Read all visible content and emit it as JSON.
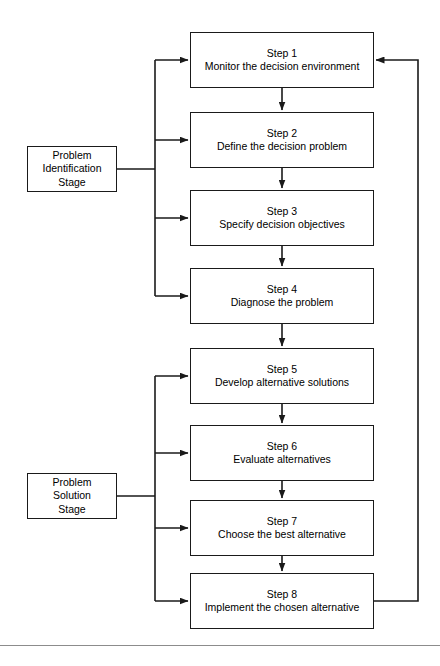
{
  "diagram": {
    "stages": [
      {
        "id": "problem-identification-stage",
        "lines": [
          "Problem",
          "Identification",
          "Stage"
        ],
        "x": 27,
        "y": 146,
        "w": 90,
        "h": 46,
        "connects_to": [
          "step-1",
          "step-2",
          "step-3",
          "step-4"
        ]
      },
      {
        "id": "problem-solution-stage",
        "lines": [
          "Problem",
          "Solution",
          "Stage"
        ],
        "x": 27,
        "y": 473,
        "w": 90,
        "h": 46,
        "connects_to": [
          "step-5",
          "step-6",
          "step-7",
          "step-8"
        ]
      }
    ],
    "steps": [
      {
        "id": "step-1",
        "label": "Step 1",
        "desc": "Monitor the decision environment",
        "x": 190,
        "y": 32,
        "w": 184,
        "h": 56
      },
      {
        "id": "step-2",
        "label": "Step 2",
        "desc": "Define the decision problem",
        "x": 190,
        "y": 112,
        "w": 184,
        "h": 56
      },
      {
        "id": "step-3",
        "label": "Step 3",
        "desc": "Specify decision objectives",
        "x": 190,
        "y": 190,
        "w": 184,
        "h": 56
      },
      {
        "id": "step-4",
        "label": "Step 4",
        "desc": "Diagnose the problem",
        "x": 190,
        "y": 268,
        "w": 184,
        "h": 56
      },
      {
        "id": "step-5",
        "label": "Step 5",
        "desc": "Develop alternative solutions",
        "x": 190,
        "y": 348,
        "w": 184,
        "h": 56
      },
      {
        "id": "step-6",
        "label": "Step 6",
        "desc": "Evaluate alternatives",
        "x": 190,
        "y": 425,
        "w": 184,
        "h": 56
      },
      {
        "id": "step-7",
        "label": "Step 7",
        "desc": "Choose the best alternative",
        "x": 190,
        "y": 500,
        "w": 184,
        "h": 56
      },
      {
        "id": "step-8",
        "label": "Step 8",
        "desc": "Implement the chosen alternative",
        "x": 190,
        "y": 573,
        "w": 184,
        "h": 56
      }
    ],
    "flow_arrows": [
      {
        "from": "step-1",
        "to": "step-2"
      },
      {
        "from": "step-2",
        "to": "step-3"
      },
      {
        "from": "step-3",
        "to": "step-4"
      },
      {
        "from": "step-4",
        "to": "step-5"
      },
      {
        "from": "step-5",
        "to": "step-6"
      },
      {
        "from": "step-6",
        "to": "step-7"
      },
      {
        "from": "step-7",
        "to": "step-8"
      }
    ],
    "feedback_loop": {
      "from": "step-8",
      "to": "step-1",
      "side": "right"
    },
    "colors": {
      "stroke": "#1a1a1a",
      "background": "#ffffff",
      "rule": "#8c8c8c"
    },
    "bottom_rule": {
      "y": 645
    }
  }
}
